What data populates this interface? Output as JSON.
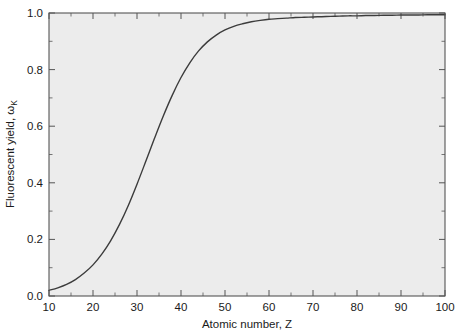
{
  "chart_data": {
    "type": "line",
    "title": "",
    "subtitle": "",
    "xlabel": "Atomic number, Z",
    "ylabel": "Fluorescent yield, ω",
    "ylabel_subscript": "K",
    "xlim": [
      10,
      100
    ],
    "ylim": [
      0.0,
      1.0
    ],
    "grid": false,
    "legend": false,
    "legend_position": "none",
    "x_major_step": 10,
    "x_minor_step": 5,
    "y_major_step": 0.2,
    "y_minor_step": 0.1,
    "tick_direction": "in",
    "xticklabels": [
      "10",
      "20",
      "30",
      "40",
      "50",
      "60",
      "70",
      "80",
      "90",
      "100"
    ],
    "xtickvalues": [
      10,
      20,
      30,
      40,
      50,
      60,
      70,
      80,
      90,
      100
    ],
    "yticklabels": [
      "0.0",
      "0.2",
      "0.4",
      "0.6",
      "0.8",
      "1.0"
    ],
    "ytickvalues": [
      0.0,
      0.2,
      0.4,
      0.6,
      0.8,
      1.0
    ],
    "series": [
      {
        "name": "K-shell fluorescence yield",
        "x": [
          10,
          12,
          14,
          16,
          18,
          20,
          22,
          24,
          26,
          28,
          30,
          32,
          34,
          36,
          38,
          40,
          42,
          44,
          46,
          48,
          50,
          52,
          54,
          56,
          58,
          60,
          62,
          64,
          66,
          68,
          70,
          72,
          74,
          76,
          78,
          80,
          82,
          84,
          86,
          88,
          90,
          92,
          94,
          96,
          98,
          100
        ],
        "y": [
          0.02,
          0.029,
          0.041,
          0.058,
          0.081,
          0.11,
          0.148,
          0.195,
          0.252,
          0.319,
          0.395,
          0.476,
          0.558,
          0.637,
          0.709,
          0.772,
          0.824,
          0.866,
          0.898,
          0.922,
          0.94,
          0.953,
          0.962,
          0.969,
          0.974,
          0.978,
          0.98,
          0.982,
          0.984,
          0.985,
          0.986,
          0.987,
          0.988,
          0.989,
          0.99,
          0.99,
          0.991,
          0.991,
          0.992,
          0.992,
          0.993,
          0.993,
          0.993,
          0.994,
          0.994,
          0.994
        ],
        "color": "#3c3c3c",
        "linewidth": 1.4
      }
    ],
    "annotations": []
  },
  "style": {
    "plot_background": "#ececec",
    "figure_background": "#ffffff",
    "frame_color": "#555555",
    "text_color": "#1a1a1a",
    "curve_color": "#3c3c3c"
  }
}
